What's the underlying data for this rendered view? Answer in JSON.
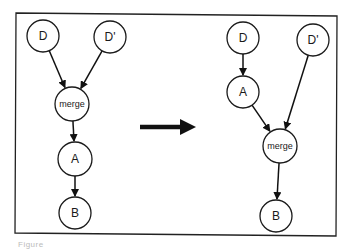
{
  "figure": {
    "caption": "Figure",
    "frame": {
      "x1": 16,
      "y1": 13,
      "x2": 337,
      "y2": 235
    },
    "transform_arrow": {
      "x1": 140,
      "y1": 127,
      "x2": 198,
      "y2": 127
    }
  },
  "left_graph": {
    "nodes": [
      {
        "id": "D",
        "label": "D",
        "cx": 43,
        "cy": 36,
        "r": 16
      },
      {
        "id": "Dp",
        "label": "D'",
        "cx": 110,
        "cy": 37,
        "r": 16
      },
      {
        "id": "merge",
        "label": "merge",
        "cx": 72,
        "cy": 104,
        "r": 17
      },
      {
        "id": "A",
        "label": "A",
        "cx": 75,
        "cy": 159,
        "r": 17
      },
      {
        "id": "B",
        "label": "B",
        "cx": 75,
        "cy": 213,
        "r": 16
      }
    ],
    "edges": [
      {
        "from": "D",
        "to": "merge"
      },
      {
        "from": "Dp",
        "to": "merge"
      },
      {
        "from": "merge",
        "to": "A"
      },
      {
        "from": "A",
        "to": "B"
      }
    ]
  },
  "right_graph": {
    "nodes": [
      {
        "id": "D",
        "label": "D",
        "cx": 243,
        "cy": 38,
        "r": 16
      },
      {
        "id": "Dp",
        "label": "D'",
        "cx": 313,
        "cy": 40,
        "r": 16
      },
      {
        "id": "A",
        "label": "A",
        "cx": 243,
        "cy": 92,
        "r": 16
      },
      {
        "id": "merge",
        "label": "merge",
        "cx": 280,
        "cy": 146,
        "r": 17
      },
      {
        "id": "B",
        "label": "B",
        "cx": 276,
        "cy": 216,
        "r": 16
      }
    ],
    "edges": [
      {
        "from": "D",
        "to": "A"
      },
      {
        "from": "A",
        "to": "merge"
      },
      {
        "from": "Dp",
        "to": "merge"
      },
      {
        "from": "merge",
        "to": "B"
      }
    ]
  }
}
